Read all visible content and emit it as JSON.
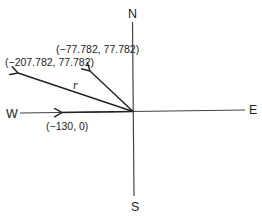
{
  "diagram": {
    "compass": {
      "north": "N",
      "south": "S",
      "east": "E",
      "west": "W"
    },
    "vectors": [
      {
        "id": "vector-west",
        "label": "(−130, 0)",
        "x": -130,
        "y": 0
      },
      {
        "id": "vector-nw",
        "label": "(−77.782, 77.782)",
        "x": -77.782,
        "y": 77.782
      },
      {
        "id": "vector-resultant",
        "label": "(−207.782, 77.782)",
        "x": -207.782,
        "y": 77.782,
        "name": "r"
      }
    ],
    "colors": {
      "stroke": "#222222"
    }
  }
}
